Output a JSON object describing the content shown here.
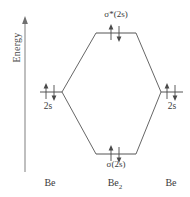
{
  "axis": {
    "label": "Energy",
    "direction": "up",
    "arrow_icon": "up-arrow-icon"
  },
  "diagram": {
    "type": "molecular-orbital-energy-diagram",
    "molecule": "Be2",
    "line_color": "#555555",
    "text_color": "#3a3a3a",
    "levels": [
      {
        "id": "sigma-star-2s",
        "label_prefix": "σ",
        "label_star": "*",
        "label_suffix_open": "(2",
        "label_italic": "s",
        "label_suffix_close": ")",
        "label_full": "σ*(2s)",
        "label_position": "above",
        "electrons": "↑↓",
        "electron_count": 2,
        "x_center": 116,
        "y": 33,
        "half_width": 20
      },
      {
        "id": "2s-left",
        "label_full": "2s",
        "label_prefix": "2",
        "label_italic": "s",
        "label_position": "below",
        "electrons": "↑↓",
        "electron_count": 2,
        "x_center": 51,
        "y": 92,
        "half_width": 11
      },
      {
        "id": "2s-right",
        "label_full": "2s",
        "label_prefix": "2",
        "label_italic": "s",
        "label_position": "below",
        "electrons": "↑↓",
        "electron_count": 2,
        "x_center": 172,
        "y": 92,
        "half_width": 11
      },
      {
        "id": "sigma-2s",
        "label_prefix": "σ",
        "label_star": "",
        "label_suffix_open": "(2",
        "label_italic": "s",
        "label_suffix_close": ")",
        "label_full": "σ(2s)",
        "label_position": "below",
        "electrons": "↑↓",
        "electron_count": 2,
        "x_center": 116,
        "y": 154,
        "half_width": 20
      }
    ]
  },
  "species": {
    "left": {
      "text": "Be",
      "sub": ""
    },
    "middle": {
      "text": "Be",
      "sub": "2"
    },
    "right": {
      "text": "Be",
      "sub": ""
    }
  }
}
